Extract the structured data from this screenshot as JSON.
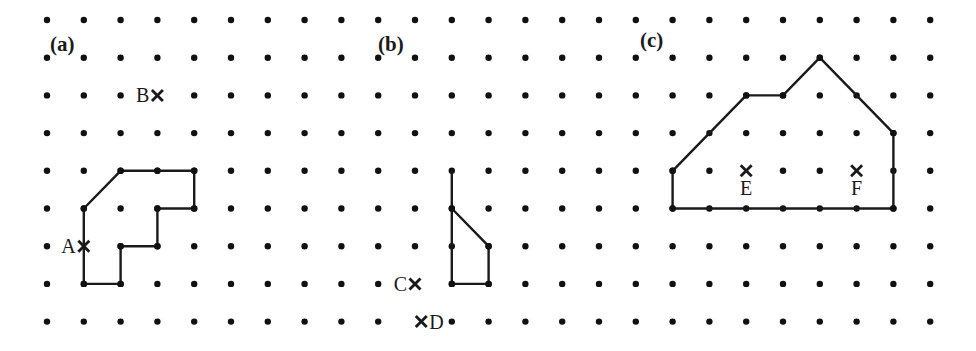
{
  "figure": {
    "grid": {
      "columns": 25,
      "rows": 9,
      "origin_x": 47,
      "origin_y": 20,
      "spacing_x": 36.8,
      "spacing_y": 37.7,
      "dot_radius": 3.2,
      "dot_color": "#111111"
    },
    "line_color": "#1a1a1a",
    "panels": [
      {
        "id": "a",
        "label": "(a)",
        "label_pos": [
          50,
          51
        ],
        "shape": {
          "closed": true,
          "vertices": [
            [
              1,
              5
            ],
            [
              2,
              4
            ],
            [
              3,
              4
            ],
            [
              4,
              4
            ],
            [
              4,
              5
            ],
            [
              3,
              5
            ],
            [
              3,
              6
            ],
            [
              2,
              6
            ],
            [
              2,
              7
            ],
            [
              1,
              7
            ]
          ]
        },
        "points": [
          {
            "name": "A",
            "label": "A",
            "at": [
              1,
              6
            ],
            "label_side": "left"
          },
          {
            "name": "B",
            "label": "B",
            "at": [
              3,
              2
            ],
            "label_side": "left"
          }
        ]
      },
      {
        "id": "b",
        "label": "(b)",
        "label_pos": [
          378,
          51
        ],
        "shape": {
          "closed": true,
          "vertices": [
            [
              11,
              5
            ],
            [
              12,
              6
            ],
            [
              12,
              7
            ],
            [
              11,
              7
            ]
          ],
          "extra_segments": [
            [
              [
                11,
                4
              ],
              [
                11,
                5
              ]
            ]
          ]
        },
        "points": [
          {
            "name": "C",
            "label": "C",
            "at": [
              10,
              7
            ],
            "label_side": "left"
          },
          {
            "name": "D",
            "label": "D",
            "at": [
              10.17,
              8
            ],
            "label_side": "right"
          }
        ]
      },
      {
        "id": "c",
        "label": "(c)",
        "label_pos": [
          640,
          47
        ],
        "shape": {
          "closed": true,
          "vertices": [
            [
              17,
              4
            ],
            [
              19,
              2
            ],
            [
              20,
              2
            ],
            [
              21,
              1
            ],
            [
              23,
              3
            ],
            [
              23,
              5
            ],
            [
              17,
              5
            ]
          ]
        },
        "points": [
          {
            "name": "E",
            "label": "E",
            "at": [
              19,
              4
            ],
            "label_side": "below"
          },
          {
            "name": "F",
            "label": "F",
            "at": [
              22,
              4
            ],
            "label_side": "below"
          }
        ]
      }
    ]
  }
}
